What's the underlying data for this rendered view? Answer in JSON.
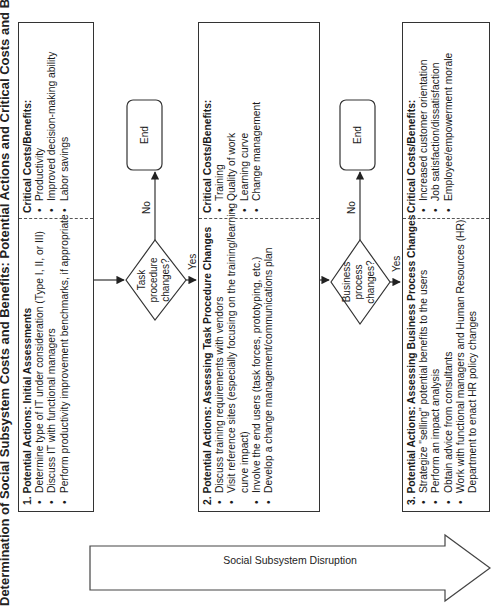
{
  "title": "Determination of Social Subsystem Costs and Benefits: Potential Actions and Critical Costs and Benefits",
  "stages": [
    {
      "number": "1.",
      "heading_prefix": "Potential Actions:",
      "heading": "1. Potential Actions: Initial Assessments",
      "actions": [
        "Determine type of IT under consideration (Type I, II, or III)",
        "Discuss IT with functional managers",
        "Perform productivity improvement benchmarks, if appropriate"
      ],
      "benefits_heading": "Critical Costs/Benefits:",
      "benefits": [
        "Productivity",
        "Improved decision-making ability",
        "Labor savings"
      ]
    },
    {
      "heading": "2. Potential Actions: Assessing Task Procedure Changes",
      "actions": [
        "Discuss training requirements with vendors",
        "Visit reference sites (especially focusing on the training/learning",
        "curve impact)",
        "Involve the end users (task forces, prototyping, etc.)",
        "Develop a change management/communications plan"
      ],
      "benefits_heading": "Critical Costs/Benefits:",
      "benefits": [
        "Training",
        "Quality of work",
        "Learning curve",
        "Change management"
      ]
    },
    {
      "heading": "3. Potential Actions: Assessing Business Process Changes",
      "actions": [
        "Strategize \"selling\" potential benefits to the users",
        "Perform an impact analysis",
        "Obtain advice from consultants",
        "Work with functional managers and Human Resources (HR)",
        "Department to enact HR policy changes"
      ],
      "benefits_heading": "Critical Costs/Benefits:",
      "benefits": [
        "Increased customer orientation",
        "Job satisfaction/dissatisfaction",
        "Employee/empowerment morale"
      ]
    }
  ],
  "decisions": [
    {
      "line1": "Task",
      "line2": "procedure",
      "line3": "changes?",
      "yes": "Yes",
      "no": "No",
      "end": "End"
    },
    {
      "line1": "Business",
      "line2": "process",
      "line3": "changes?",
      "yes": "Yes",
      "no": "No",
      "end": "End"
    }
  ],
  "arrow": {
    "label": "Social Subsystem Disruption"
  },
  "colors": {
    "stroke": "#333333",
    "text": "#1a1a1a",
    "background": "#ffffff"
  }
}
